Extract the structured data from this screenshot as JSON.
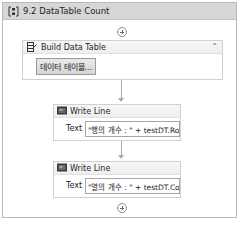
{
  "sequence": {
    "title": "9.2 DataTable Count",
    "icon": "sequence-icon"
  },
  "activities": {
    "build": {
      "title": "Build Data Table",
      "icon": "build-data-table-icon",
      "button_label": "데이터 테이블...",
      "collapse_icon": "collapse-chevrons-icon"
    },
    "write1": {
      "title": "Write Line",
      "icon": "write-line-icon",
      "field_label": "Text",
      "value": "\"행의 개수 : \" + testDT.Rows"
    },
    "write2": {
      "title": "Write Line",
      "icon": "write-line-icon",
      "field_label": "Text",
      "value": "\"열의 개수 : \" + testDT.Colur"
    }
  },
  "colors": {
    "header_bg": "#d7d7d7",
    "border": "#b9b9b9",
    "connector": "#a8a8a8"
  }
}
